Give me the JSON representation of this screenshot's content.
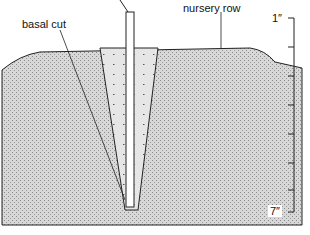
{
  "diagram": {
    "labels": {
      "basal_cut": "basal cut",
      "nursery_row": "nursery row",
      "ruler_top": "1″",
      "ruler_bottom": "7″"
    },
    "ruler": {
      "ticks": 7,
      "unit": "inch"
    }
  }
}
